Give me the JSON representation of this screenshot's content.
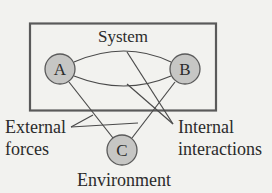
{
  "diagram": {
    "system_box": {
      "label": "System"
    },
    "nodes": [
      {
        "id": "A",
        "label": "A",
        "region": "system"
      },
      {
        "id": "B",
        "label": "B",
        "region": "system"
      },
      {
        "id": "C",
        "label": "C",
        "region": "environment"
      }
    ],
    "edges": [
      {
        "from": "A",
        "to": "B",
        "type": "internal"
      },
      {
        "from": "A",
        "to": "B",
        "type": "internal"
      },
      {
        "from": "A",
        "to": "C",
        "type": "external"
      },
      {
        "from": "B",
        "to": "C",
        "type": "external"
      }
    ],
    "annotations": {
      "external_line1": "External",
      "external_line2": "forces",
      "internal_line1": "Internal",
      "internal_line2": "interactions",
      "environment": "Environment"
    },
    "colors": {
      "node_fill": "#c6c6c4",
      "stroke": "#555555",
      "background": "#f2f2ef"
    }
  }
}
